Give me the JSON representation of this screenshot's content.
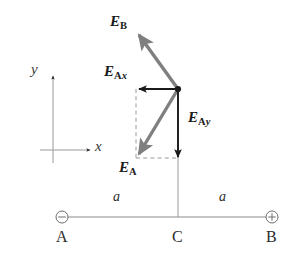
{
  "figure": {
    "width": 301,
    "height": 257,
    "background": "#ffffff"
  },
  "colors": {
    "resultant_vector": "#7f7f7f",
    "component_vector": "#1a1a1a",
    "construction_line": "#9a9a9a",
    "dashed_guide": "#9a9a9a",
    "text": "#1a1a1a",
    "baseline": "#8c8c8c"
  },
  "axes": {
    "x_label": "x",
    "y_label": "y",
    "x_axis_name": "x-axis-arrow",
    "y_axis_name": "y-axis-arrow",
    "origin": {
      "x": 53,
      "y": 150
    }
  },
  "vectors": [
    {
      "id": "E_B",
      "label_main": "E",
      "label_sub": "B",
      "label_sub_italic": "",
      "color": "#7f7f7f",
      "style": "solid",
      "from": {
        "x": 178,
        "y": 89
      },
      "to": {
        "x": 137,
        "y": 32
      },
      "description": "Field at C due to positive charge B, directed away from B (up and to the left)"
    },
    {
      "id": "E_A",
      "label_main": "E",
      "label_sub": "A",
      "label_sub_italic": "",
      "color": "#7f7f7f",
      "style": "solid",
      "from": {
        "x": 178,
        "y": 89
      },
      "to": {
        "x": 136,
        "y": 158
      },
      "description": "Field at C due to negative charge A, directed toward A (down and to the left)"
    },
    {
      "id": "E_Ax",
      "label_main": "E",
      "label_sub": "A",
      "label_sub_italic": "x",
      "color": "#1a1a1a",
      "style": "solid",
      "from": {
        "x": 178,
        "y": 89
      },
      "to": {
        "x": 136,
        "y": 89
      },
      "description": "Horizontal component of E_A, pointing in the negative x direction"
    },
    {
      "id": "E_Ay",
      "label_main": "E",
      "label_sub": "A",
      "label_sub_italic": "y",
      "color": "#1a1a1a",
      "style": "solid",
      "from": {
        "x": 178,
        "y": 89
      },
      "to": {
        "x": 178,
        "y": 160
      },
      "description": "Vertical component of E_A, pointing in the negative y direction"
    }
  ],
  "labels": {
    "E_B": {
      "text_main": "E",
      "sub": "B",
      "x": 110,
      "y": 14
    },
    "E_Ax": {
      "text_main": "E",
      "sub": "A",
      "sub_ital": "x",
      "x": 104,
      "y": 64
    },
    "E_Ay": {
      "text_main": "E",
      "sub": "A",
      "sub_ital": "y",
      "x": 188,
      "y": 110
    },
    "E_A": {
      "text_main": "E",
      "sub": "A",
      "x": 119,
      "y": 160
    },
    "axis_y": {
      "text": "y",
      "x": 31,
      "y": 62
    },
    "axis_x": {
      "text": "x",
      "x": 95,
      "y": 139
    }
  },
  "charges": [
    {
      "id": "A",
      "name": "charge-a",
      "label": "A",
      "sign": "-",
      "symbol": "minus-in-circle",
      "x": 62,
      "y": 217,
      "label_x": 62,
      "label_y": 231
    },
    {
      "id": "B",
      "name": "charge-b",
      "label": "B",
      "sign": "+",
      "symbol": "plus-in-circle",
      "x": 272,
      "y": 217,
      "label_x": 272,
      "label_y": 231
    }
  ],
  "point_c": {
    "label": "C",
    "x": 178,
    "y": 217,
    "label_x": 178,
    "label_y": 231,
    "description": "Midpoint between charges A and B where the field is evaluated"
  },
  "distances": [
    {
      "label": "a",
      "x": 120,
      "y": 190,
      "between": "A to C"
    },
    {
      "label": "a",
      "x": 225,
      "y": 190,
      "between": "C to B"
    }
  ],
  "guides": {
    "dashed_rect": {
      "left": 136,
      "right": 178,
      "top": 89,
      "bottom": 158,
      "description": "Dashed construction rectangle showing the x and y components of E_A"
    },
    "vertical_stem": {
      "x": 178,
      "from_y": 89,
      "to_y": 217,
      "description": "Thin line joining point C to the vector origin"
    },
    "baseline": {
      "y": 217,
      "from_x": 62,
      "to_x": 272
    }
  }
}
